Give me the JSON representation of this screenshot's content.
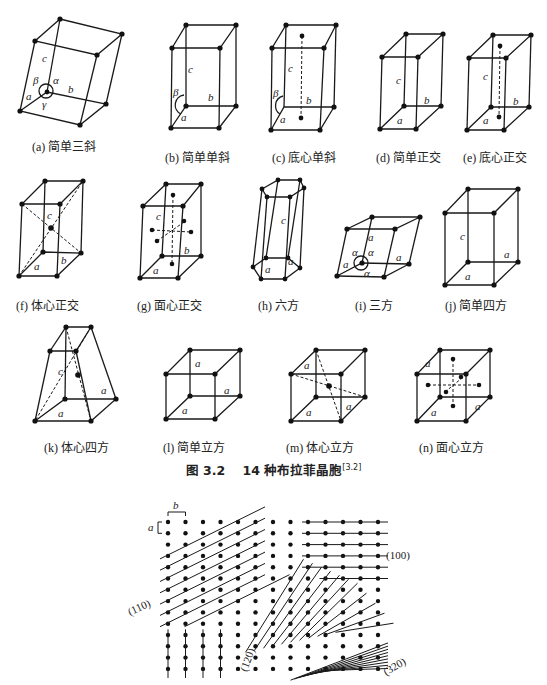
{
  "figure": {
    "number": "图 3.2",
    "title": "14 种布拉菲晶胞",
    "reference": "[3.2]"
  },
  "cells": [
    {
      "id": "a",
      "caption": "(a) 简单三斜",
      "labels": [
        "c",
        "β",
        "α",
        "b",
        "a",
        "γ"
      ]
    },
    {
      "id": "b",
      "caption": "(b) 简单单斜",
      "labels": [
        "c",
        "β",
        "b",
        "a"
      ]
    },
    {
      "id": "c",
      "caption": "(c) 底心单斜",
      "labels": [
        "c",
        "β",
        "b",
        "a"
      ]
    },
    {
      "id": "d",
      "caption": "(d) 简单正交",
      "labels": [
        "c",
        "b",
        "a"
      ]
    },
    {
      "id": "e",
      "caption": "(e) 底心正交",
      "labels": [
        "c",
        "b",
        "a"
      ]
    },
    {
      "id": "f",
      "caption": "(f) 体心正交",
      "labels": [
        "c",
        "a",
        "b"
      ]
    },
    {
      "id": "g",
      "caption": "(g) 面心正交",
      "labels": [
        "c",
        "b",
        "a"
      ]
    },
    {
      "id": "h",
      "caption": "(h) 六方",
      "labels": [
        "c",
        "a",
        "a"
      ]
    },
    {
      "id": "i",
      "caption": "(i) 三方",
      "labels": [
        "a",
        "α",
        "α",
        "α",
        "a",
        "a"
      ]
    },
    {
      "id": "j",
      "caption": "(j) 简单四方",
      "labels": [
        "c",
        "a",
        "a"
      ]
    },
    {
      "id": "k",
      "caption": "(k) 体心四方",
      "labels": [
        "c",
        "a",
        "a"
      ]
    },
    {
      "id": "l",
      "caption": "(l) 简单立方",
      "labels": [
        "a",
        "a",
        "a"
      ]
    },
    {
      "id": "m",
      "caption": "(m) 体心立方",
      "labels": [
        "a",
        "a",
        "a"
      ]
    },
    {
      "id": "n",
      "caption": "(n) 面心立方",
      "labels": [
        "a",
        "a",
        "a"
      ]
    }
  ],
  "lattice_planes": {
    "spacing_labels": {
      "a": "a",
      "b": "b"
    },
    "planes": [
      "(100)",
      "(110)",
      "(120)",
      "(320)"
    ]
  }
}
